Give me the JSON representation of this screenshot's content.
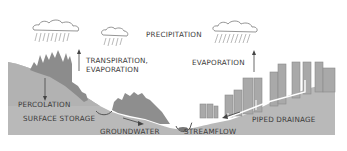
{
  "diagram": {
    "type": "water-cycle-illustration",
    "colors": {
      "terrain": "#b5b5b5",
      "terrain_light": "#c4c4c4",
      "vegetation": "#8e8e8e",
      "buildings": "#a8a8a8",
      "cloud_outline": "#7a7a7a",
      "rain": "#8a8a8a",
      "pipe": "#ffffff",
      "text": "#3a3a3a",
      "background": "#ffffff"
    },
    "labels": {
      "precipitation": "PRECIPITATION",
      "transpiration_line1": "TRANSPIRATION,",
      "transpiration_line2": "EVAPORATION",
      "evaporation": "EVAPORATION",
      "percolation": "PERCOLATION",
      "surface_storage": "SURFACE STORAGE",
      "groundwater": "GROUNDWATER",
      "streamflow": "STREAMFLOW",
      "piped_drainage": "PIPED DRAINAGE"
    },
    "elements": {
      "clouds": [
        "left-cloud",
        "center-cloud",
        "right-cloud"
      ],
      "arrows": [
        "transpiration-arrow",
        "evaporation-arrow",
        "percolation-arrow",
        "groundwater-arrow",
        "piped-drainage-arrow"
      ]
    }
  }
}
